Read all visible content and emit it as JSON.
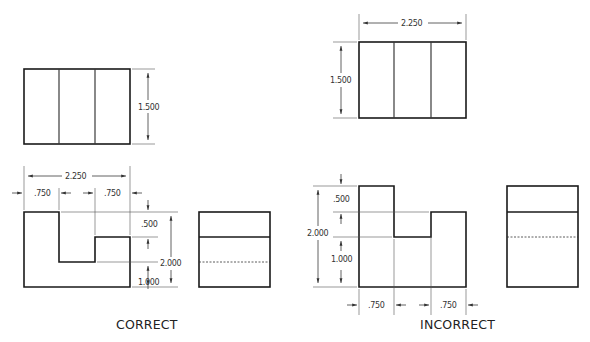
{
  "labels": {
    "correct": "CORRECT",
    "incorrect": "INCORRECT"
  },
  "correct": {
    "top_view": {
      "height_dim": "1.500"
    },
    "front_view": {
      "width_dim": "2.250",
      "left_step_dim": ".750",
      "right_step_dim": ".750",
      "upper_height_dim": ".500",
      "lower_height_dim": "1.000",
      "total_height_dim": "2.000"
    }
  },
  "incorrect": {
    "top_view": {
      "width_dim": "2.250",
      "height_dim": "1.500"
    },
    "front_view": {
      "left_step_dim": ".750",
      "right_step_dim": ".750",
      "upper_height_dim": ".500",
      "lower_height_dim": "1.000",
      "total_height_dim": "2.000"
    }
  },
  "colors": {
    "line": "#1a1a1a",
    "background": "#ffffff"
  }
}
